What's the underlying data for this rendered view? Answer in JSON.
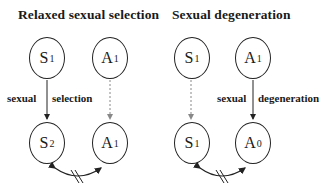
{
  "panels": [
    {
      "title": "Relaxed sexual selection",
      "nodes": [
        {
          "id": "top-left",
          "symbol": "S",
          "subscript": "1"
        },
        {
          "id": "top-right",
          "symbol": "A",
          "subscript": "1"
        },
        {
          "id": "bottom-left",
          "symbol": "S",
          "subscript": "2"
        },
        {
          "id": "bottom-right",
          "symbol": "A",
          "subscript": "1"
        }
      ],
      "edge_label_left": "sexual",
      "edge_label_right": "selection",
      "solid_arrow": "S1 → S2",
      "dashed_arrow": "A1 → A1",
      "bottom_link": "blocked bidirectional"
    },
    {
      "title": "Sexual degeneration",
      "nodes": [
        {
          "id": "top-left",
          "symbol": "S",
          "subscript": "1"
        },
        {
          "id": "top-right",
          "symbol": "A",
          "subscript": "1"
        },
        {
          "id": "bottom-left",
          "symbol": "S",
          "subscript": "1"
        },
        {
          "id": "bottom-right",
          "symbol": "A",
          "subscript": "0"
        }
      ],
      "edge_label_left": "sexual",
      "edge_label_right": "degeneration",
      "solid_arrow": "A1 → A0",
      "dashed_arrow": "S1 → S1",
      "bottom_link": "blocked bidirectional"
    }
  ],
  "colors": {
    "stroke": "#222222",
    "dashed": "#888888",
    "background": "#ffffff"
  }
}
